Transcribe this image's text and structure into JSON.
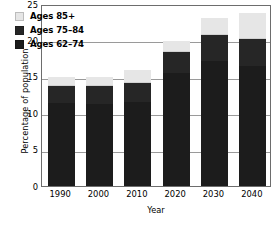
{
  "chart_data": {
    "type": "bar",
    "subtype": "stacked-bar",
    "title": "",
    "xlabel": "Year",
    "ylabel": "Percentage of population",
    "categories": [
      "1990",
      "2000",
      "2010",
      "2020",
      "2030",
      "2040"
    ],
    "series": [
      {
        "name": "Ages 62–74",
        "color": "#1c1c1c",
        "values": [
          11.5,
          11.3,
          11.6,
          15.6,
          17.3,
          16.6
        ]
      },
      {
        "name": "Ages 75–84",
        "color": "#262626",
        "values": [
          2.4,
          2.5,
          2.6,
          2.9,
          3.5,
          3.7
        ]
      },
      {
        "name": "Ages 85+",
        "color": "#e6e6e6",
        "values": [
          1.1,
          1.2,
          1.8,
          1.4,
          2.3,
          3.5
        ]
      }
    ],
    "stack_totals": [
      15.0,
      15.0,
      16.0,
      19.9,
      23.1,
      23.8
    ],
    "dark_segment_tops": [
      13.9,
      13.8,
      14.2,
      18.5,
      20.8,
      20.3
    ],
    "ylim": [
      0,
      25
    ],
    "yticks": [
      0,
      5,
      10,
      15,
      20,
      25
    ],
    "ytick_labels": [
      "0",
      "5",
      "10",
      "15",
      "20",
      "25"
    ],
    "grid": true,
    "grid_axis": "y",
    "legend_position": "upper-left-inside"
  },
  "axes": {
    "y_title": "Percentage of population",
    "x_title": "Year"
  },
  "legend": {
    "items": [
      {
        "label": "Ages 85+",
        "color": "#e6e6e6"
      },
      {
        "label": "Ages 75–84",
        "color": "#262626"
      },
      {
        "label": "Ages 62–74",
        "color": "#1c1c1c"
      }
    ]
  }
}
